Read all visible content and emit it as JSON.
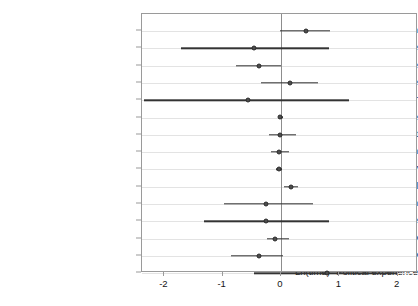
{
  "chart_data": {
    "type": "scatter",
    "title": "",
    "subtitle": "",
    "xlabel": "",
    "ylabel": "",
    "xlim": [
      -2.4,
      2.1
    ],
    "xticks": [
      -2,
      -1,
      0,
      1,
      2
    ],
    "xticklabels": [
      "-2",
      "-1",
      "0",
      "1",
      "2"
    ],
    "grid": "horizontal",
    "legend": "none",
    "reference_line": 0,
    "orientation": "horizontal",
    "annotation": "Coefficient estimates with confidence intervals; vertical reference line at zero",
    "categories": [
      "Previous term",
      "Political experience",
      "Diplomatic experience",
      "Military experience",
      "Gender",
      "Age",
      "Head of government",
      "Education",
      "Polity level of democracy",
      "Mean dispute level",
      "Number dispute win",
      "Number dispute lose",
      "Number start any MID",
      "Number end any MID",
      "Ln(time)* Political experience"
    ],
    "points": [
      {
        "label": "Previous term",
        "estimate": 0.43,
        "ci_low": -0.02,
        "ci_high": 0.84
      },
      {
        "label": "Political experience",
        "estimate": -0.46,
        "ci_low": -1.72,
        "ci_high": 0.82
      },
      {
        "label": "Diplomatic experience",
        "estimate": -0.38,
        "ci_low": -0.78,
        "ci_high": 0.0
      },
      {
        "label": "Military experience",
        "estimate": 0.16,
        "ci_low": -0.34,
        "ci_high": 0.63
      },
      {
        "label": "Gender",
        "estimate": -0.57,
        "ci_low": -2.35,
        "ci_high": 1.17
      },
      {
        "label": "Age",
        "estimate": -0.01,
        "ci_low": -0.04,
        "ci_high": 0.03
      },
      {
        "label": "Head of government",
        "estimate": -0.02,
        "ci_low": -0.21,
        "ci_high": 0.26
      },
      {
        "label": "Education",
        "estimate": -0.03,
        "ci_low": -0.17,
        "ci_high": 0.14
      },
      {
        "label": "Polity level of democracy",
        "estimate": -0.03,
        "ci_low": -0.08,
        "ci_high": 0.02
      },
      {
        "label": "Mean dispute level",
        "estimate": 0.17,
        "ci_low": 0.05,
        "ci_high": 0.29
      },
      {
        "label": "Number dispute win",
        "estimate": -0.26,
        "ci_low": -0.98,
        "ci_high": 0.55
      },
      {
        "label": "Number dispute lose",
        "estimate": -0.26,
        "ci_low": -1.32,
        "ci_high": 0.82
      },
      {
        "label": "Number start any MID",
        "estimate": -0.1,
        "ci_low": -0.24,
        "ci_high": 0.14
      },
      {
        "label": "Number end any MID",
        "estimate": -0.38,
        "ci_low": -0.86,
        "ci_high": 0.03
      },
      {
        "label": "Ln(time)* Political experience",
        "estimate": 0.79,
        "ci_low": -0.46,
        "ci_high": 2.01
      }
    ]
  }
}
